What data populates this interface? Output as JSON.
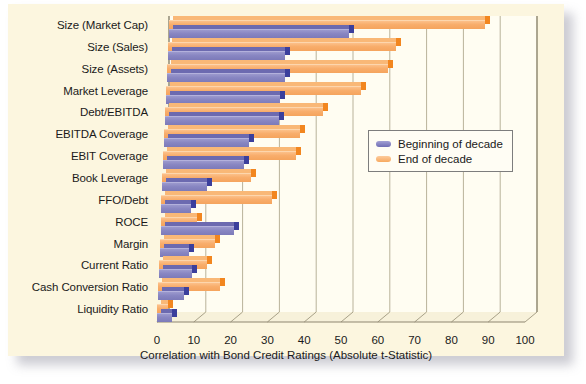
{
  "chart_data": {
    "type": "bar",
    "orientation": "horizontal",
    "title": "",
    "xlabel": "Correlation with Bond Credit Ratings (Absolute t-Statistic)",
    "ylabel": "",
    "xlim": [
      0,
      100
    ],
    "xticks": [
      0,
      10,
      20,
      30,
      40,
      50,
      60,
      70,
      80,
      90,
      100
    ],
    "grid": true,
    "legend_position": "center-right",
    "categories": [
      "Size (Market Cap)",
      "Size (Sales)",
      "Size (Assets)",
      "Market Leverage",
      "Debt/EBITDA",
      "EBITDA Coverage",
      "EBIT Coverage",
      "Book Leverage",
      "FFO/Debt",
      "ROCE",
      "Margin",
      "Current Ratio",
      "Cash Conversion Ratio",
      "Liquidity Ratio"
    ],
    "series": [
      {
        "name": "Beginning of decade",
        "color": "#7c7ab9",
        "values": [
          49,
          32,
          32,
          31,
          31,
          23,
          22,
          12,
          8,
          20,
          8,
          9,
          7,
          4
        ]
      },
      {
        "name": "End of decade",
        "color": "#f5a45d",
        "values": [
          86,
          62,
          60,
          53,
          43,
          37,
          36,
          24,
          30,
          10,
          15,
          13,
          17,
          3
        ]
      }
    ]
  },
  "legend": {
    "entries": [
      {
        "label": "Beginning of decade",
        "swatch": "blue"
      },
      {
        "label": "End of decade",
        "swatch": "orange"
      }
    ]
  },
  "axis": {
    "x_title": "Correlation with Bond Credit Ratings (Absolute t-Statistic)"
  }
}
